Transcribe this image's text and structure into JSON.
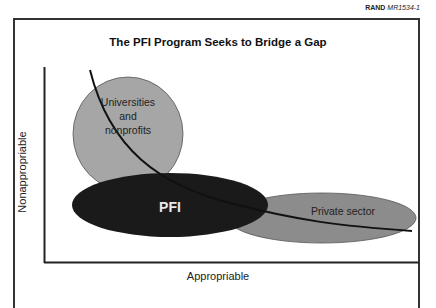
{
  "header": {
    "org": "RAND",
    "doc_id": "MR1534-1"
  },
  "title": "The PFI Program Seeks to Bridge a Gap",
  "axes": {
    "x_label": "Appropriable",
    "y_label": "Nonappropriable"
  },
  "shapes": {
    "universities": {
      "label_lines": [
        "Universities",
        "and",
        "nonprofits"
      ],
      "fill": "#a6a6a6"
    },
    "pfi": {
      "label": "PFI",
      "fill": "#1a1a1a",
      "text_color": "#e8e8e8"
    },
    "private_sector": {
      "label": "Private sector",
      "fill": "#8c8c8c"
    }
  },
  "colors": {
    "axis": "#222222",
    "curve": "#111111",
    "frame": "#333333"
  }
}
